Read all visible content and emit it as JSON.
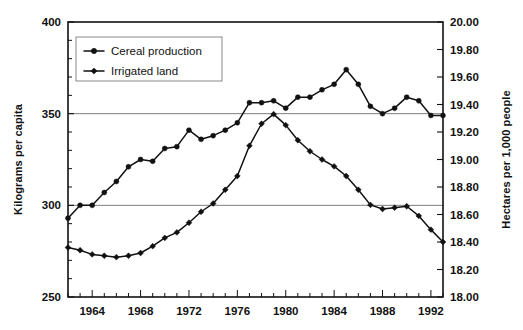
{
  "chart_data": {
    "type": "line",
    "title": "",
    "subtitle": "",
    "xlabel": "",
    "ylabel": "Kilograms per capita",
    "y2label": "Hectares per 1,000 people",
    "grid": true,
    "legend_position": "top-left",
    "xlim": [
      1962,
      1993
    ],
    "ylim": [
      250,
      400
    ],
    "y2lim": [
      18.0,
      20.0
    ],
    "x_tick_labels": [
      "1964",
      "1968",
      "1972",
      "1976",
      "1980",
      "1984",
      "1988",
      "1992"
    ],
    "x_ticks": [
      1964,
      1968,
      1972,
      1976,
      1980,
      1984,
      1988,
      1992
    ],
    "x_minor_ticks": [
      1962,
      1963,
      1964,
      1965,
      1966,
      1967,
      1968,
      1969,
      1970,
      1971,
      1972,
      1973,
      1974,
      1975,
      1976,
      1977,
      1978,
      1979,
      1980,
      1981,
      1982,
      1983,
      1984,
      1985,
      1986,
      1987,
      1988,
      1989,
      1990,
      1991,
      1992,
      1993
    ],
    "y_tick_labels": [
      "250",
      "300",
      "350",
      "400"
    ],
    "y_ticks": [
      250,
      300,
      350,
      400
    ],
    "y_minor_ticks": [
      260,
      270,
      280,
      290,
      310,
      320,
      330,
      340,
      360,
      370,
      380,
      390
    ],
    "y2_tick_labels": [
      "18.00",
      "18.20",
      "18.40",
      "18.60",
      "18.80",
      "19.00",
      "19.20",
      "19.40",
      "19.60",
      "19.80",
      "20.00"
    ],
    "y2_ticks": [
      18.0,
      18.2,
      18.4,
      18.6,
      18.8,
      19.0,
      19.2,
      19.4,
      19.6,
      19.8,
      20.0
    ],
    "gridline_values": [
      300,
      350
    ],
    "x": [
      1962,
      1963,
      1964,
      1965,
      1966,
      1967,
      1968,
      1969,
      1970,
      1971,
      1972,
      1973,
      1974,
      1975,
      1976,
      1977,
      1978,
      1979,
      1980,
      1981,
      1982,
      1983,
      1984,
      1985,
      1986,
      1987,
      1988,
      1989,
      1990,
      1991,
      1992,
      1993
    ],
    "series": [
      {
        "name": "Cereal production",
        "axis": "left",
        "marker": "circle",
        "units": "Kilograms per capita",
        "values": [
          293,
          300,
          300,
          307,
          313,
          321,
          325,
          324,
          331,
          332,
          341,
          336,
          338,
          341,
          345,
          356,
          356,
          357,
          353,
          359,
          359,
          363,
          366,
          374,
          366,
          354,
          350,
          353,
          359,
          357,
          349,
          349
        ]
      },
      {
        "name": "Irrigated land",
        "axis": "right",
        "marker": "diamond",
        "units": "Hectares per 1,000 people",
        "values": [
          18.36,
          18.34,
          18.31,
          18.3,
          18.29,
          18.3,
          18.32,
          18.37,
          18.43,
          18.47,
          18.54,
          18.62,
          18.68,
          18.78,
          18.88,
          19.1,
          19.26,
          19.33,
          19.25,
          19.14,
          19.06,
          19.0,
          18.95,
          18.88,
          18.78,
          18.67,
          18.64,
          18.65,
          18.66,
          18.59,
          18.49,
          18.4
        ]
      }
    ],
    "legend": [
      {
        "label": "Cereal production",
        "marker": "circle"
      },
      {
        "label": "Irrigated land",
        "marker": "diamond"
      }
    ]
  }
}
